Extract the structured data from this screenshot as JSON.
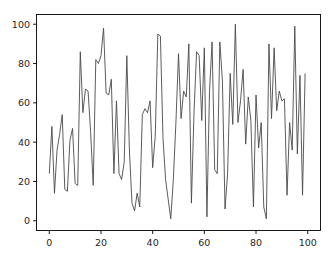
{
  "chart_data": {
    "type": "line",
    "title": "",
    "subtitle": "",
    "xlabel": "",
    "ylabel": "",
    "xlim": [
      -4.95,
      104.95
    ],
    "ylim": [
      -4.95,
      104.95
    ],
    "xticks": [
      0,
      20,
      40,
      60,
      80,
      100
    ],
    "yticks": [
      0,
      20,
      40,
      60,
      80,
      100
    ],
    "xtick_labels": [
      "0",
      "20",
      "40",
      "60",
      "80",
      "100"
    ],
    "ytick_labels": [
      "0",
      "20",
      "40",
      "60",
      "80",
      "100"
    ],
    "grid": false,
    "legend": false,
    "legend_position": "none",
    "line_color": "#4a4a4a",
    "line_width": 0.9,
    "background_color": "#ffffff",
    "axes_color": "#000000",
    "series": [
      {
        "name": "series-1",
        "x": [
          0,
          1,
          2,
          3,
          4,
          5,
          6,
          7,
          8,
          9,
          10,
          11,
          12,
          13,
          14,
          15,
          16,
          17,
          18,
          19,
          20,
          21,
          22,
          23,
          24,
          25,
          26,
          27,
          28,
          29,
          30,
          31,
          32,
          33,
          34,
          35,
          36,
          37,
          38,
          39,
          40,
          41,
          42,
          43,
          44,
          45,
          46,
          47,
          48,
          49,
          50,
          51,
          52,
          53,
          54,
          55,
          56,
          57,
          58,
          59,
          60,
          61,
          62,
          63,
          64,
          65,
          66,
          67,
          68,
          69,
          70,
          71,
          72,
          73,
          74,
          75,
          76,
          77,
          78,
          79,
          80,
          81,
          82,
          83,
          84,
          85,
          86,
          87,
          88,
          89,
          90,
          91,
          92,
          93,
          94,
          95,
          96,
          97,
          98,
          99
        ],
        "values": [
          24,
          48,
          14,
          36,
          44,
          54,
          16,
          15,
          41,
          47,
          19,
          18,
          86,
          55,
          67,
          66,
          45,
          18,
          82,
          80,
          84,
          98,
          65,
          64,
          72,
          24,
          61,
          24,
          21,
          30,
          84,
          36,
          9,
          5,
          14,
          7,
          54,
          57,
          55,
          61,
          27,
          43,
          95,
          94,
          42,
          21,
          11,
          1,
          21,
          50,
          85,
          52,
          66,
          63,
          90,
          9,
          55,
          86,
          84,
          51,
          88,
          2,
          66,
          91,
          26,
          24,
          91,
          71,
          6,
          24,
          75,
          49,
          100,
          50,
          61,
          77,
          39,
          63,
          51,
          7,
          64,
          37,
          50,
          7,
          1,
          90,
          52,
          88,
          56,
          66,
          61,
          62,
          13,
          50,
          36,
          99,
          34,
          74,
          13,
          75
        ]
      }
    ]
  }
}
